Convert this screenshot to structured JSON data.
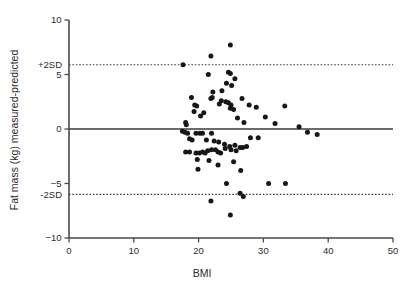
{
  "chart_data": {
    "type": "scatter",
    "title": "",
    "xlabel": "BMI",
    "ylabel": "Fat mass (kg) measured-predicted",
    "xlim": [
      0,
      50
    ],
    "ylim": [
      -10,
      10
    ],
    "xticks": [
      0,
      10,
      20,
      30,
      40,
      50
    ],
    "yticks": [
      10,
      5,
      0,
      -5,
      -10
    ],
    "xtick_labels": [
      "0",
      "10",
      "20",
      "30",
      "40",
      "50"
    ],
    "ytick_labels": [
      "10",
      "5",
      "0",
      "-5",
      "-10"
    ],
    "grid": false,
    "legend": "none",
    "reference_lines": [
      {
        "name": "mean-line",
        "label": "",
        "y": 0,
        "style": "solid"
      },
      {
        "name": "upper-limit-of-agreement",
        "label": "+2SD",
        "y": 5.9,
        "style": "dotted"
      },
      {
        "name": "lower-limit-of-agreement",
        "label": "-2SD",
        "y": -6.0,
        "style": "dotted"
      }
    ],
    "series": [
      {
        "name": "subjects",
        "marker": "filled-circle",
        "color": "#17171a",
        "points": [
          [
            17.6,
            5.9
          ],
          [
            21.9,
            6.7
          ],
          [
            24.9,
            7.7
          ],
          [
            21.5,
            5.0
          ],
          [
            24.6,
            5.2
          ],
          [
            24.9,
            5.1
          ],
          [
            25.6,
            4.6
          ],
          [
            24.3,
            4.2
          ],
          [
            25.1,
            4.0
          ],
          [
            23.6,
            3.5
          ],
          [
            22.2,
            3.4
          ],
          [
            18.9,
            2.9
          ],
          [
            22.1,
            2.9
          ],
          [
            21.9,
            2.8
          ],
          [
            26.7,
            2.8
          ],
          [
            23.5,
            2.6
          ],
          [
            24.2,
            2.5
          ],
          [
            24.6,
            2.4
          ],
          [
            23.2,
            2.3
          ],
          [
            25.0,
            2.2
          ],
          [
            27.8,
            2.2
          ],
          [
            33.3,
            2.1
          ],
          [
            19.4,
            2.2
          ],
          [
            19.7,
            2.1
          ],
          [
            24.9,
            1.9
          ],
          [
            25.4,
            1.8
          ],
          [
            19.3,
            1.6
          ],
          [
            20.8,
            1.5
          ],
          [
            28.9,
            2.0
          ],
          [
            20.3,
            1.2
          ],
          [
            26.0,
            1.0
          ],
          [
            30.3,
            1.1
          ],
          [
            18.0,
            0.6
          ],
          [
            27.0,
            0.6
          ],
          [
            18.1,
            0.4
          ],
          [
            31.8,
            0.5
          ],
          [
            35.5,
            0.2
          ],
          [
            17.5,
            -0.2
          ],
          [
            17.9,
            -0.3
          ],
          [
            18.3,
            -0.4
          ],
          [
            19.6,
            -0.4
          ],
          [
            20.2,
            -0.4
          ],
          [
            20.6,
            -0.4
          ],
          [
            22.0,
            -0.4
          ],
          [
            36.8,
            -0.3
          ],
          [
            38.3,
            -0.5
          ],
          [
            29.2,
            -0.8
          ],
          [
            28.0,
            -0.8
          ],
          [
            18.6,
            -0.9
          ],
          [
            19.0,
            -1.0
          ],
          [
            21.2,
            -1.0
          ],
          [
            22.4,
            -1.1
          ],
          [
            23.1,
            -1.2
          ],
          [
            24.0,
            -1.4
          ],
          [
            24.8,
            -1.6
          ],
          [
            25.6,
            -1.5
          ],
          [
            26.4,
            -1.7
          ],
          [
            26.8,
            -1.7
          ],
          [
            27.4,
            -1.6
          ],
          [
            18.0,
            -2.1
          ],
          [
            18.6,
            -2.1
          ],
          [
            19.6,
            -2.2
          ],
          [
            20.1,
            -2.2
          ],
          [
            20.6,
            -2.1
          ],
          [
            21.0,
            -2.2
          ],
          [
            21.4,
            -2.0
          ],
          [
            22.0,
            -1.9
          ],
          [
            22.6,
            -1.9
          ],
          [
            23.0,
            -2.1
          ],
          [
            23.4,
            -2.2
          ],
          [
            24.1,
            -1.8
          ],
          [
            25.0,
            -1.9
          ],
          [
            25.8,
            -2.0
          ],
          [
            19.8,
            -2.8
          ],
          [
            21.6,
            -2.9
          ],
          [
            23.0,
            -3.3
          ],
          [
            25.4,
            -3.0
          ],
          [
            19.9,
            -3.7
          ],
          [
            26.5,
            -3.8
          ],
          [
            24.3,
            -5.0
          ],
          [
            30.8,
            -5.0
          ],
          [
            33.4,
            -5.0
          ],
          [
            26.4,
            -5.9
          ],
          [
            26.9,
            -6.2
          ],
          [
            21.9,
            -6.6
          ],
          [
            24.9,
            -7.9
          ]
        ]
      }
    ]
  },
  "axis": {
    "x_title": "BMI",
    "y_title": "Fat mass (kg) measured-predicted"
  }
}
